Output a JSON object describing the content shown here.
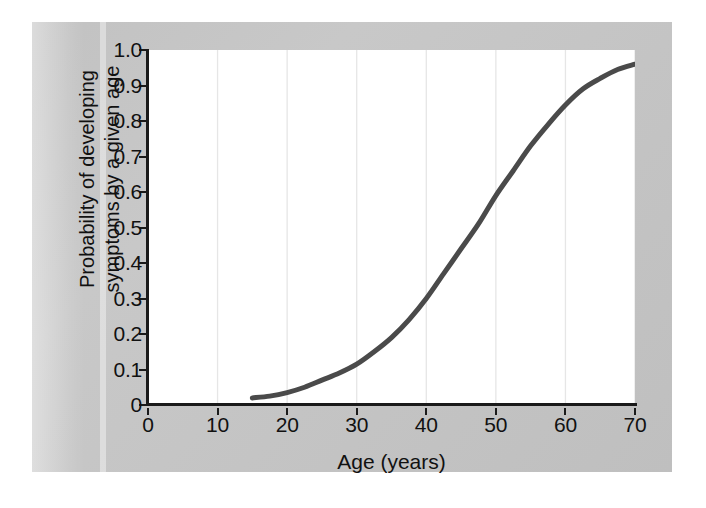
{
  "figure": {
    "background_color": "#ffffff",
    "panel_color": "#c4c4c4",
    "plot_background": "#ffffff",
    "axis_color": "#1a1a1a",
    "gridline_color": "#e6e6e6",
    "curve_color": "#4a4a4a"
  },
  "axes": {
    "x_title": "Age (years)",
    "y_title_line1": "Probability of developing",
    "y_title_line2": "symptoms by a given age",
    "x_ticks": [
      "0",
      "10",
      "20",
      "30",
      "40",
      "50",
      "60",
      "70"
    ],
    "y_ticks": [
      "1.0",
      "0.9",
      "0.8",
      "0.7",
      "0.6",
      "0.5",
      "0.4",
      "0.3",
      "0.2",
      "0.1",
      "0"
    ]
  },
  "chart_data": {
    "type": "line",
    "title": "",
    "subtitle": "",
    "xlabel": "Age (years)",
    "ylabel": "Probability of developing symptoms by a given age",
    "xlim": [
      0,
      70
    ],
    "ylim": [
      0,
      1.0
    ],
    "xticks": [
      0,
      10,
      20,
      30,
      40,
      50,
      60,
      70
    ],
    "yticks": [
      0,
      0.1,
      0.2,
      0.3,
      0.4,
      0.5,
      0.6,
      0.7,
      0.8,
      0.9,
      1.0
    ],
    "grid": "vertical-only",
    "legend": "none",
    "annotations": [],
    "series": [
      {
        "name": "Cumulative probability of symptom onset",
        "line_color": "#4a4a4a",
        "line_width": 5,
        "x": [
          15,
          17.5,
          20,
          22.5,
          25,
          27.5,
          30,
          32.5,
          35,
          37.5,
          40,
          42.5,
          45,
          47.5,
          50,
          52.5,
          55,
          57.5,
          60,
          62.5,
          65,
          67.5,
          70
        ],
        "values": [
          0.02,
          0.025,
          0.035,
          0.05,
          0.07,
          0.09,
          0.115,
          0.15,
          0.19,
          0.24,
          0.3,
          0.37,
          0.44,
          0.51,
          0.59,
          0.66,
          0.73,
          0.79,
          0.845,
          0.89,
          0.92,
          0.945,
          0.96
        ]
      }
    ]
  }
}
